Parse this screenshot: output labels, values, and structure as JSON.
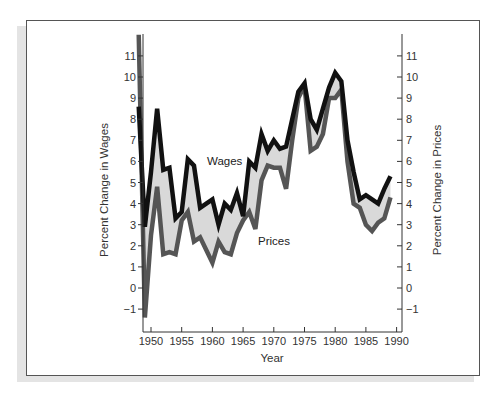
{
  "chart_data": {
    "type": "line",
    "title": "",
    "xlabel": "Year",
    "ylabel_left": "Percent Change in Wages",
    "ylabel_right": "Percent Change in Prices",
    "xlim": [
      1948,
      1990
    ],
    "ylim": [
      -1,
      11
    ],
    "x_ticks": [
      1950,
      1955,
      1960,
      1965,
      1970,
      1975,
      1980,
      1985,
      1990
    ],
    "y_ticks": [
      -1,
      0,
      1,
      2,
      3,
      4,
      5,
      6,
      7,
      8,
      9,
      10,
      11
    ],
    "grid": false,
    "legend": "inline labels",
    "shaded_between_series": true,
    "x": [
      1948,
      1949,
      1950,
      1951,
      1952,
      1953,
      1954,
      1955,
      1956,
      1957,
      1958,
      1959,
      1960,
      1961,
      1962,
      1963,
      1964,
      1965,
      1966,
      1967,
      1968,
      1969,
      1970,
      1971,
      1972,
      1973,
      1974,
      1975,
      1976,
      1977,
      1978,
      1979,
      1980,
      1981,
      1982,
      1983,
      1984,
      1985,
      1986,
      1987,
      1988,
      1989
    ],
    "series": [
      {
        "name": "Wages",
        "color": "#111111",
        "values": [
          8.6,
          2.9,
          5.5,
          8.5,
          5.6,
          5.7,
          3.3,
          3.6,
          6.1,
          5.8,
          3.8,
          4.0,
          4.2,
          3.0,
          4.0,
          3.7,
          4.5,
          3.4,
          6.0,
          5.7,
          7.3,
          6.5,
          7.0,
          6.6,
          6.7,
          8.0,
          9.3,
          9.7,
          8.0,
          7.5,
          8.5,
          9.5,
          10.2,
          9.8,
          7.0,
          5.5,
          4.2,
          4.4,
          4.2,
          4.0,
          4.7,
          5.3
        ]
      },
      {
        "name": "Prices",
        "color": "#555555",
        "values": [
          12.0,
          -1.4,
          2.5,
          4.8,
          1.6,
          1.7,
          1.6,
          3.2,
          3.6,
          2.2,
          2.4,
          1.8,
          1.2,
          2.2,
          1.7,
          1.6,
          2.6,
          3.2,
          3.6,
          2.8,
          5.1,
          5.8,
          5.7,
          5.7,
          4.7,
          7.0,
          9.0,
          9.6,
          6.5,
          6.7,
          7.3,
          9.0,
          9.0,
          9.4,
          6.0,
          4.0,
          3.8,
          3.0,
          2.7,
          3.1,
          3.3,
          4.3
        ]
      }
    ],
    "annotations": [
      {
        "text": "Wages",
        "x": 1959,
        "y": 6.0
      },
      {
        "text": "Prices",
        "x": 1967.5,
        "y": 2.5
      }
    ]
  },
  "labels": {
    "xlabel": "Year",
    "ylabel_left": "Percent Change in Wages",
    "ylabel_right": "Percent Change in Prices",
    "wages": "Wages",
    "prices": "Prices"
  }
}
